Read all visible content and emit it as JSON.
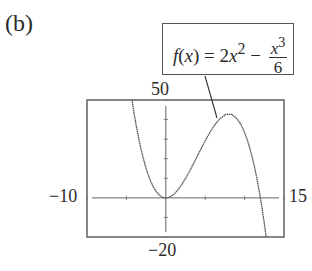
{
  "panel": {
    "label": "(b)"
  },
  "formula": {
    "lhs": "f(x) = 2x",
    "lhs_exp": "2",
    "minus": " − ",
    "num_base": "x",
    "num_exp": "3",
    "den": "6",
    "full_text": "f(x) = 2x^2 − x^3/6"
  },
  "axes": {
    "xmin_label": "−10",
    "xmax_label": "15",
    "ymax_label": "50",
    "ymin_label": "−20"
  },
  "colors": {
    "curve": "#555555",
    "frame": "#555555",
    "axis": "#666666"
  },
  "chart_data": {
    "type": "line",
    "title": "(b)",
    "function": "f(x) = 2x^2 - x^3/6",
    "xlabel": "",
    "ylabel": "",
    "xlim": [
      -10,
      15
    ],
    "ylim": [
      -20,
      50
    ],
    "xscale_tick": 5,
    "yscale_tick": 10,
    "grid": false,
    "legend": "none",
    "annotations": [
      {
        "text": "f(x) = 2x^2 − x^3/6",
        "points_to": [
          8,
          42.7
        ]
      }
    ],
    "window_labels": {
      "xmin": -10,
      "xmax": 15,
      "ymin": -20,
      "ymax": 50
    },
    "series": [
      {
        "name": "f(x) = 2x^2 - x^3/6",
        "x": [
          -4.3,
          -4,
          -3,
          -2,
          -1,
          0,
          1,
          2,
          3,
          4,
          5,
          6,
          7,
          8,
          9,
          10,
          11,
          12,
          12.74
        ],
        "y": [
          50.2,
          42.7,
          22.5,
          9.3,
          2.2,
          0,
          1.8,
          6.7,
          13.5,
          21.3,
          29.2,
          36,
          40.8,
          42.7,
          40.5,
          33.3,
          20.2,
          0,
          -20
        ]
      }
    ],
    "key_points": {
      "local_min": [
        0,
        0
      ],
      "local_max": [
        8,
        42.67
      ],
      "root": [
        12,
        0
      ]
    }
  }
}
